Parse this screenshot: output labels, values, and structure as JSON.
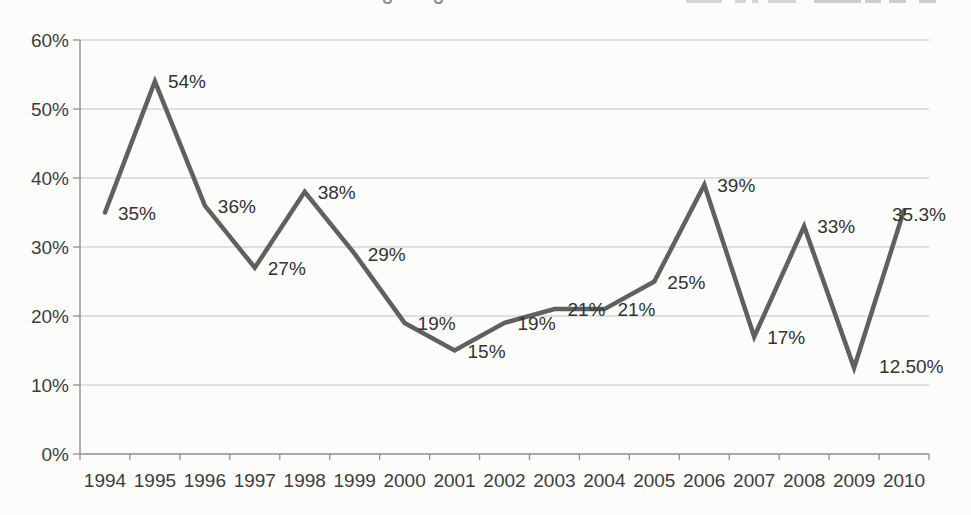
{
  "page": {
    "background": "#fcfcfb"
  },
  "chart_data": {
    "type": "line",
    "title": "",
    "xlabel": "",
    "ylabel": "",
    "categories": [
      "1994",
      "1995",
      "1996",
      "1997",
      "1998",
      "1999",
      "2000",
      "2001",
      "2002",
      "2003",
      "2004",
      "2005",
      "2006",
      "2007",
      "2008",
      "2009",
      "2010"
    ],
    "values": [
      35,
      54,
      36,
      27,
      38,
      29,
      19,
      15,
      19,
      21,
      21,
      25,
      39,
      17,
      33,
      12.5,
      35.3
    ],
    "point_labels": [
      "35%",
      "54%",
      "36%",
      "27%",
      "38%",
      "29%",
      "19%",
      "15%",
      "19%",
      "21%",
      "21%",
      "25%",
      "39%",
      "17%",
      "33%",
      "12.50%",
      "35.3%"
    ],
    "ylim": [
      0,
      60
    ],
    "ytick_values": [
      0,
      10,
      20,
      30,
      40,
      50,
      60
    ],
    "ytick_labels": [
      "0%",
      "10%",
      "20%",
      "30%",
      "40%",
      "50%",
      "60%"
    ],
    "grid": "horizontal",
    "legend": "none",
    "colors": {
      "line": "#606060",
      "grid": "#c2c2c2",
      "axis": "#8f8f8f",
      "tick_text": "#3d3d3d",
      "label_text": "#333333"
    }
  }
}
